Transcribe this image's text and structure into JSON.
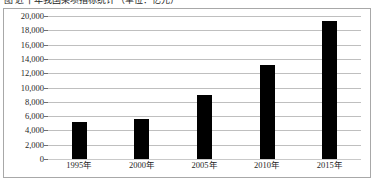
{
  "caption": {
    "text": "图  近十年我国某项指标统计（单位：亿元）"
  },
  "chart_data": {
    "type": "bar",
    "title": "",
    "xlabel": "",
    "ylabel": "",
    "categories": [
      "1995年",
      "2000年",
      "2005年",
      "2010年",
      "2015年"
    ],
    "values": [
      5200,
      5600,
      8900,
      13100,
      19300
    ],
    "series": [
      {
        "name": "数值",
        "values": [
          5200,
          5600,
          8900,
          13100,
          19300
        ]
      }
    ],
    "ylim": [
      0,
      20000
    ],
    "ytick_values": [
      0,
      2000,
      4000,
      6000,
      8000,
      10000,
      12000,
      14000,
      16000,
      18000,
      20000
    ],
    "ytick_labels": [
      "0",
      "2,000",
      "4,000",
      "6,000",
      "8,000",
      "10,000",
      "12,000",
      "14,000",
      "16,000",
      "18,000",
      "20,000"
    ],
    "grid": true,
    "legend": false,
    "legend_position": "none",
    "bar_color": "#000000",
    "gridline_color": "#bfbfbf",
    "plot_background": "#ffffff"
  }
}
